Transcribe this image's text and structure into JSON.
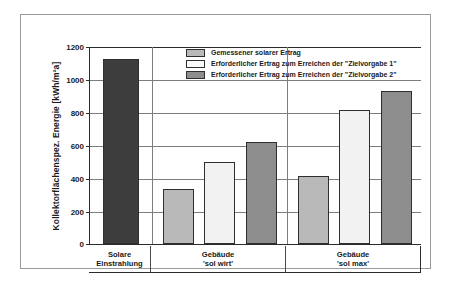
{
  "chart_data": {
    "type": "bar",
    "title": "",
    "xlabel": "",
    "ylabel": "Kollektorflächenspez. Energie [kWh/m²a]",
    "ylim": [
      0,
      1200
    ],
    "ytick_step": 200,
    "yticks": [
      "0",
      "200",
      "400",
      "600",
      "800",
      "1000",
      "1200"
    ],
    "grid": "horizontal",
    "legend_position": "top-center-inside",
    "categories": [
      {
        "line1": "Solare",
        "line2": "Einstrahlung"
      },
      {
        "line1": "Gebäude",
        "line2": "'sol wirt'"
      },
      {
        "line1": "Gebäude",
        "line2": "'sol max'"
      }
    ],
    "legend": [
      {
        "key": "measured",
        "label": "Gemessener solarer Ertrag",
        "color": "#b9b9b9"
      },
      {
        "key": "target1",
        "label": "Erforderlicher Ertrag zum Erreichen der \"Zielvorgabe 1\"",
        "color": "#f2f2f2"
      },
      {
        "key": "target2",
        "label": "Erforderlicher Ertrag zum Erreichen der \"Zielvorgabe 2\"",
        "color": "#8d8d8d"
      }
    ],
    "bars": [
      {
        "name": "solare-einstrahlung",
        "group": "Solare Einstrahlung",
        "series": "Solare Einstrahlung",
        "value": 1120,
        "color": "#3d3d3d"
      },
      {
        "name": "sol-wirt-gemessen",
        "group": "Gebäude 'sol wirt'",
        "series": "Gemessener solarer Ertrag",
        "value": 333,
        "color": "#b9b9b9"
      },
      {
        "name": "sol-wirt-zielvorgabe-1",
        "group": "Gebäude 'sol wirt'",
        "series": "Erforderlicher Ertrag zum Erreichen der \"Zielvorgabe 1\"",
        "value": 500,
        "color": "#f2f2f2"
      },
      {
        "name": "sol-wirt-zielvorgabe-2",
        "group": "Gebäude 'sol wirt'",
        "series": "Erforderlicher Ertrag zum Erreichen der \"Zielvorgabe 2\"",
        "value": 620,
        "color": "#8d8d8d"
      },
      {
        "name": "sol-max-gemessen",
        "group": "Gebäude 'sol max'",
        "series": "Gemessener solarer Ertrag",
        "value": 410,
        "color": "#b9b9b9"
      },
      {
        "name": "sol-max-zielvorgabe-1",
        "group": "Gebäude 'sol max'",
        "series": "Erforderlicher Ertrag zum Erreichen der \"Zielvorgabe 1\"",
        "value": 815,
        "color": "#f2f2f2"
      },
      {
        "name": "sol-max-zielvorgabe-2",
        "group": "Gebäude 'sol max'",
        "series": "Erforderlicher Ertrag zum Erreichen der \"Zielvorgabe 2\"",
        "value": 925,
        "color": "#8d8d8d"
      }
    ]
  }
}
